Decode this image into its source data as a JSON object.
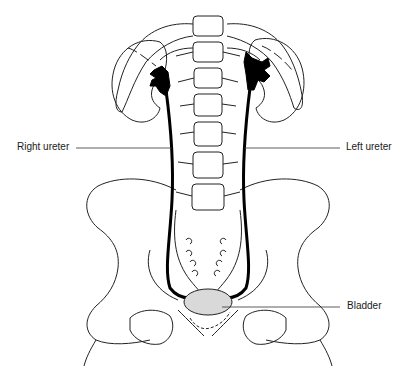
{
  "diagram": {
    "type": "anatomical-illustration",
    "labels": {
      "right_ureter": "Right ureter",
      "left_ureter": "Left ureter",
      "bladder": "Bladder"
    },
    "colors": {
      "line": "#222222",
      "ureter": "#000000",
      "bladder_fill": "#d9d9d9",
      "background": "#ffffff"
    }
  }
}
